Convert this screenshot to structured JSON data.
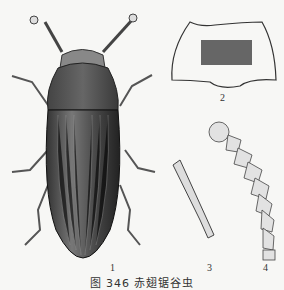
{
  "figure": {
    "caption": "图 346 赤翅锯谷虫",
    "labels": {
      "part1": "1",
      "part2": "2",
      "part3": "3",
      "part4": "4"
    },
    "parts": [
      {
        "id": "1",
        "description": "beetle dorsal view"
      },
      {
        "id": "2",
        "description": "pronotum outline"
      },
      {
        "id": "3",
        "description": "leg segment"
      },
      {
        "id": "4",
        "description": "antenna"
      }
    ]
  }
}
